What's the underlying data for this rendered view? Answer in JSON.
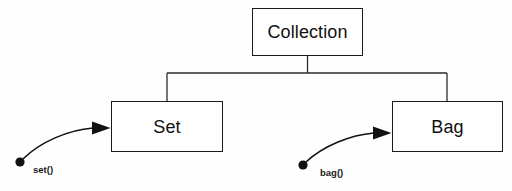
{
  "diagram": {
    "type": "class-hierarchy-tree",
    "background_color": "#fefefe",
    "line_color": "#1a1a1a",
    "nodes": [
      {
        "id": "collection",
        "label": "Collection",
        "role": "root"
      },
      {
        "id": "set",
        "label": "Set",
        "role": "child"
      },
      {
        "id": "bag",
        "label": "Bag",
        "role": "child"
      }
    ],
    "edges": [
      {
        "from": "collection",
        "to": "set",
        "style": "orthogonal"
      },
      {
        "from": "collection",
        "to": "bag",
        "style": "orthogonal"
      }
    ],
    "callouts": [
      {
        "id": "set-call",
        "label": "set()",
        "target": "set",
        "marker": "filled-dot",
        "arrow": "curved-filled-arrowhead"
      },
      {
        "id": "bag-call",
        "label": "bag()",
        "target": "bag",
        "marker": "filled-dot",
        "arrow": "curved-filled-arrowhead"
      }
    ]
  }
}
